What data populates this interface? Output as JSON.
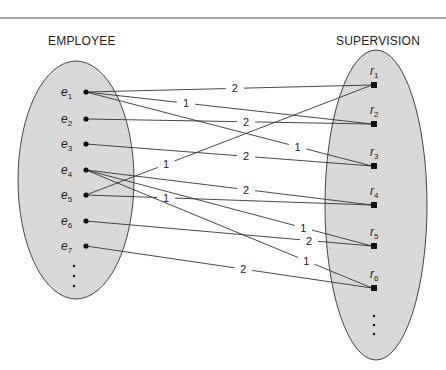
{
  "diagram": {
    "left_set": {
      "title": "EMPLOYEE",
      "fill": "#d8d8d8",
      "stroke": "#444444"
    },
    "right_set": {
      "title": "SUPERVISION",
      "fill": "#d8d8d8",
      "stroke": "#444444"
    },
    "employees": [
      {
        "id": "e1",
        "base": "e",
        "sub": "1",
        "x": 86,
        "y": 92
      },
      {
        "id": "e2",
        "base": "e",
        "sub": "2",
        "x": 86,
        "y": 119
      },
      {
        "id": "e3",
        "base": "e",
        "sub": "3",
        "x": 86,
        "y": 144
      },
      {
        "id": "e4",
        "base": "e",
        "sub": "4",
        "x": 86,
        "y": 170
      },
      {
        "id": "e5",
        "base": "e",
        "sub": "5",
        "x": 86,
        "y": 195
      },
      {
        "id": "e6",
        "base": "e",
        "sub": "6",
        "x": 86,
        "y": 221
      },
      {
        "id": "e7",
        "base": "e",
        "sub": "7",
        "x": 86,
        "y": 246
      }
    ],
    "relationships": [
      {
        "id": "r1",
        "base": "r",
        "sub": "1",
        "x": 374,
        "y": 85
      },
      {
        "id": "r2",
        "base": "r",
        "sub": "2",
        "x": 374,
        "y": 124
      },
      {
        "id": "r3",
        "base": "r",
        "sub": "3",
        "x": 374,
        "y": 166
      },
      {
        "id": "r4",
        "base": "r",
        "sub": "4",
        "x": 374,
        "y": 205
      },
      {
        "id": "r5",
        "base": "r",
        "sub": "5",
        "x": 374,
        "y": 246
      },
      {
        "id": "r6",
        "base": "r",
        "sub": "6",
        "x": 374,
        "y": 288
      }
    ],
    "edges": [
      {
        "from": "e1",
        "to": "r1",
        "role": "2",
        "t": 0.52
      },
      {
        "from": "e1",
        "to": "r2",
        "role": "1",
        "t": 0.35
      },
      {
        "from": "e1",
        "to": "r3",
        "role": "1",
        "t": 0.74
      },
      {
        "from": "e2",
        "to": "r2",
        "role": "2",
        "t": 0.56
      },
      {
        "from": "e3",
        "to": "r3",
        "role": "2",
        "t": 0.56
      },
      {
        "from": "e4",
        "to": "r4",
        "role": "2",
        "t": 0.56
      },
      {
        "from": "e4",
        "to": "r5",
        "role": "1",
        "t": 0.76
      },
      {
        "from": "e4",
        "to": "r6",
        "role": "1",
        "t": 0.77
      },
      {
        "from": "e5",
        "to": "r1",
        "role": "1",
        "t": 0.28
      },
      {
        "from": "e5",
        "to": "r4",
        "role": "1",
        "t": 0.28
      },
      {
        "from": "e6",
        "to": "r5",
        "role": "2",
        "t": 0.78
      },
      {
        "from": "e7",
        "to": "r6",
        "role": "2",
        "t": 0.55
      }
    ],
    "left_ellipsis": "⋮",
    "right_ellipsis": "⋮"
  }
}
